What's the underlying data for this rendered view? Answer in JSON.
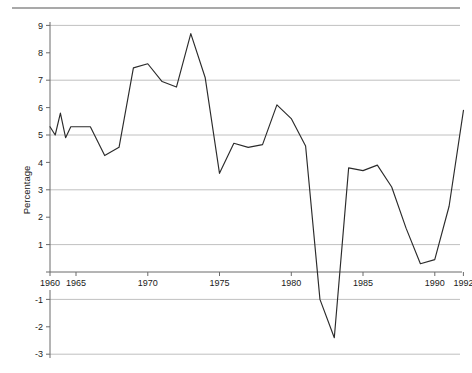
{
  "figure": {
    "background_color": "#ffffff",
    "line_color": "#2b2b2b",
    "grid_color": "#b0b0b0",
    "axis_color": "#6b6b6b"
  },
  "chart_data": {
    "type": "line",
    "title": "",
    "xlabel": "",
    "ylabel": "Percentage",
    "xlim": [
      1960,
      1992
    ],
    "ylim": [
      -3,
      9
    ],
    "grid": true,
    "grid_axis": "y",
    "grid_values": [
      9,
      7,
      5,
      3,
      1,
      -1,
      -3
    ],
    "legend": "none",
    "xticks": [
      1960,
      1965,
      1970,
      1975,
      1980,
      1985,
      1990,
      1992
    ],
    "xtick_labels": [
      "1960",
      "1965",
      "1970",
      "1975",
      "1980",
      "1985",
      "1990",
      "1992"
    ],
    "yticks": [
      9,
      8,
      7,
      6,
      5,
      4,
      3,
      2,
      1,
      0,
      -1,
      -2,
      -3
    ],
    "ytick_labels": [
      "9",
      "8",
      "7",
      "6",
      "5",
      "4",
      "3",
      "2",
      "1",
      "",
      "-1",
      "-2",
      "-3"
    ],
    "x": [
      1960,
      1961,
      1962,
      1963,
      1964,
      1965,
      1966,
      1967,
      1968,
      1969,
      1970,
      1971,
      1972,
      1973,
      1974,
      1975,
      1976,
      1977,
      1978,
      1979,
      1980,
      1981,
      1982,
      1983,
      1984,
      1985,
      1986,
      1987,
      1988,
      1989,
      1990,
      1991,
      1992
    ],
    "values": [
      5.3,
      5.0,
      5.8,
      4.9,
      5.3,
      5.3,
      5.3,
      4.25,
      4.55,
      7.45,
      7.6,
      6.95,
      6.75,
      8.7,
      7.1,
      3.6,
      4.7,
      4.55,
      4.65,
      6.1,
      5.6,
      4.6,
      -1.0,
      -2.4,
      3.8,
      3.7,
      3.9,
      3.1,
      1.6,
      0.3,
      0.45,
      2.4,
      5.9
    ],
    "series_name": "Percentage"
  },
  "axis": {
    "ylabel": "Percentage"
  }
}
